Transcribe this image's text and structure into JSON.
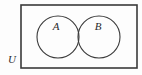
{
  "figure": {
    "kind": "venn-diagram",
    "background_color": "#fdfdfd",
    "stroke_color": "#3a3a3a",
    "label_color": "#2b2b2b"
  },
  "universe": {
    "label": "U",
    "label_x": 12,
    "label_y": 60,
    "rect": {
      "x": 21,
      "y": 5,
      "width": 116,
      "height": 63
    },
    "stroke_width": 1.6
  },
  "sets": [
    {
      "label": "A",
      "cx": 58,
      "cy": 37,
      "r": 21,
      "label_x": 56,
      "label_y": 27,
      "stroke_width": 1.1
    },
    {
      "label": "B",
      "cx": 99,
      "cy": 37,
      "r": 21,
      "label_x": 98,
      "label_y": 27,
      "stroke_width": 1.1
    }
  ]
}
